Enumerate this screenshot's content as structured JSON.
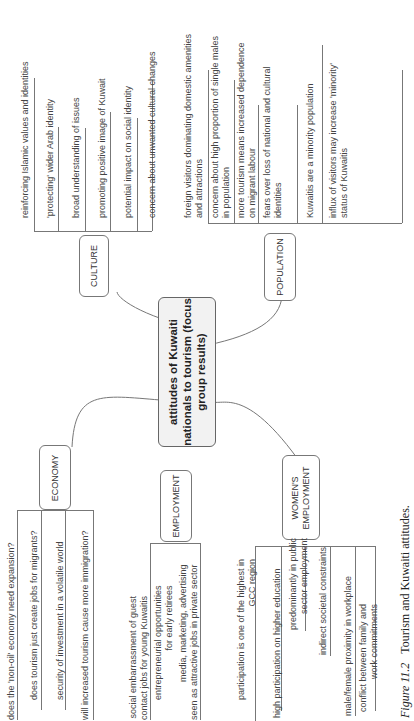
{
  "center": {
    "line1": "attitudes of Kuwaiti",
    "line2": "nationals to tourism (focus",
    "line3": "group results)"
  },
  "branches": {
    "culture": {
      "label": "CULTURE",
      "items": [
        "reinforcing Islamic values and identities",
        "'protecting' wider Arab identity",
        "broad understanding of issues",
        "promoting positive image of Kuwait",
        "potential impact on social identity",
        "concern about unwanted cultural changes"
      ]
    },
    "population": {
      "label": "POPULATION",
      "items": [
        {
          "l1": "foreign visitors dominating domestic amenities",
          "l2": "and attractions"
        },
        {
          "l1": "concern about high proportion of single males",
          "l2": "in population"
        },
        {
          "l1": "more tourism means increased dependence",
          "l2": "on migrant labour"
        },
        {
          "l1": "fears over loss of national and cultural",
          "l2": "identities"
        },
        {
          "l1": "Kuwaitis are a minority population",
          "l2": ""
        },
        {
          "l1": "influx of visitors may increase 'minority'",
          "l2": "status of Kuwaitis"
        }
      ]
    },
    "economy": {
      "label": "ECONOMY",
      "items": [
        "does the 'non-oil' economy need expansion?",
        "does tourism just create jobs for migrants?",
        "security of investment in a volatile world",
        "will increased tourism cause more immigration?"
      ]
    },
    "employment": {
      "label": "EMPLOYMENT",
      "items": [
        {
          "l1": "social embarrassment of guest",
          "l2": "contact jobs for young Kuwaitis"
        },
        {
          "l1": "entrepreneurial opportunities",
          "l2": "for early retirees"
        },
        {
          "l1": "media, marketing, advertising",
          "l2": "seen as attractive jobs in private sector"
        }
      ]
    },
    "womens_employment": {
      "label1": "WOMEN'S",
      "label2": "EMPLOYMENT",
      "items": [
        {
          "l1": "participation is one of the highest in",
          "l2": "GCC region"
        },
        {
          "l1": "high participation on higher education",
          "l2": ""
        },
        {
          "l1": "predominantly in public",
          "l2": "sector employment"
        },
        {
          "l1": "indirect societal constraints",
          "l2": ""
        },
        {
          "l1": "male/female proximity in workplace",
          "l2": ""
        },
        {
          "l1": "conflict between family and",
          "l2": "work commitments"
        }
      ]
    }
  },
  "caption": {
    "figure": "Figure 11.2",
    "text": "Tourism and Kuwaiti attitudes."
  }
}
